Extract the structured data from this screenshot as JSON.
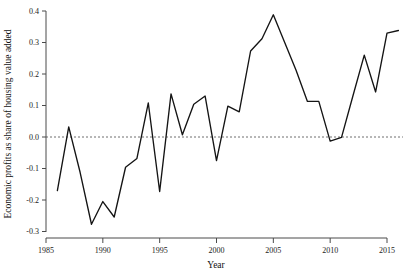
{
  "chart_data": {
    "type": "line",
    "title": "",
    "subtitle": "",
    "xlabel": "Year",
    "ylabel": "Economic profits as share of housing value added",
    "xlim": [
      1985,
      2016.4
    ],
    "ylim": [
      -0.3,
      0.4
    ],
    "grid": false,
    "legend": null,
    "legend_position": "none",
    "xticks": [
      1985,
      1990,
      1995,
      2000,
      2005,
      2010,
      2015
    ],
    "xtick_labels": [
      "1985",
      "1990",
      "1995",
      "2000",
      "2005",
      "2010",
      "2015"
    ],
    "yticks": [
      -0.3,
      -0.2,
      -0.1,
      0.0,
      0.1,
      0.2,
      0.3,
      0.4
    ],
    "ytick_labels": [
      "-0.3",
      "-0.2",
      "-0.1",
      "0.0",
      "0.1",
      "0.2",
      "0.3",
      "0.4"
    ],
    "annotations": [
      {
        "kind": "reference-line",
        "axis": "y",
        "value": 0.0,
        "style": "dashed"
      }
    ],
    "x": [
      1986,
      1987,
      1988,
      1989,
      1990,
      1991,
      1992,
      1993,
      1994,
      1995,
      1996,
      1997,
      1998,
      1999,
      2000,
      2001,
      2002,
      2003,
      2004,
      2005,
      2006,
      2007,
      2008,
      2009,
      2010,
      2011,
      2012,
      2013,
      2014,
      2015,
      2016
    ],
    "values": [
      -0.17,
      0.032,
      -0.112,
      -0.277,
      -0.205,
      -0.254,
      -0.096,
      -0.068,
      0.108,
      -0.173,
      0.137,
      0.007,
      0.104,
      0.13,
      -0.075,
      0.098,
      0.08,
      0.273,
      0.312,
      0.388,
      0.3,
      0.212,
      0.113,
      0.113,
      -0.013,
      -0.001,
      0.13,
      0.26,
      0.143,
      0.33,
      0.338
    ],
    "series": [
      {
        "name": "Economic profits as share of housing value added",
        "color": "#141414",
        "x": [
          1986,
          1987,
          1988,
          1989,
          1990,
          1991,
          1992,
          1993,
          1994,
          1995,
          1996,
          1997,
          1998,
          1999,
          2000,
          2001,
          2002,
          2003,
          2004,
          2005,
          2006,
          2007,
          2008,
          2009,
          2010,
          2011,
          2012,
          2013,
          2014,
          2015,
          2016
        ],
        "values": [
          -0.17,
          0.032,
          -0.112,
          -0.277,
          -0.205,
          -0.254,
          -0.096,
          -0.068,
          0.108,
          -0.173,
          0.137,
          0.007,
          0.104,
          0.13,
          -0.075,
          0.098,
          0.08,
          0.273,
          0.312,
          0.388,
          0.3,
          0.212,
          0.113,
          0.113,
          -0.013,
          -0.001,
          0.13,
          0.26,
          0.143,
          0.33,
          0.338
        ]
      }
    ]
  },
  "axis": {
    "x_title": "Year",
    "y_title": "Economic profits as share of housing value added"
  },
  "colors": {
    "line": "#141414",
    "axis": "#4a4a4a",
    "zero_reference": "#6e6e6e",
    "background": "#ffffff"
  }
}
